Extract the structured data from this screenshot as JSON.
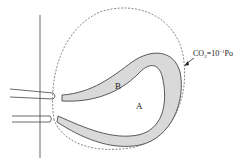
{
  "diagram": {
    "labels": {
      "region_b": "B",
      "region_a": "A",
      "annotation_main": "CO",
      "annotation_sub": "2",
      "annotation_eq": "=10",
      "annotation_sup": "−1",
      "annotation_unit": "Po"
    },
    "colors": {
      "stroke": "#333333",
      "fill_band": "#d9d9d9",
      "dashed": "#555555"
    }
  }
}
